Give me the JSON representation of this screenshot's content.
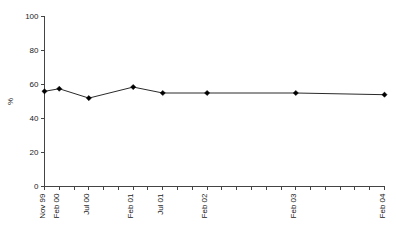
{
  "chart_data": {
    "type": "line",
    "title": "",
    "xlabel": "",
    "ylabel": "%",
    "ylim": [
      0,
      100
    ],
    "yticks": [
      0,
      20,
      40,
      60,
      80,
      100
    ],
    "ytick_labels": [
      "0",
      "20",
      "40",
      "60",
      "80",
      "100"
    ],
    "grid": false,
    "legend": false,
    "legend_position": "none",
    "categories": [
      "Nov 99",
      "Feb 00",
      "Jul 00",
      "Feb 01",
      "Jul 01",
      "Feb 02",
      "Feb 03",
      "Feb 04"
    ],
    "x": [
      0,
      1,
      3,
      6,
      8,
      11,
      17,
      23
    ],
    "values": [
      56,
      57.5,
      52,
      58.5,
      55,
      55,
      55,
      54
    ],
    "x_axis": {
      "minor_tick_count": 24,
      "labeled_ticks": [
        {
          "index": 0,
          "label": "Nov 99"
        },
        {
          "index": 1,
          "label": "Feb 00"
        },
        {
          "index": 3,
          "label": "Jul 00"
        },
        {
          "index": 6,
          "label": "Feb 01"
        },
        {
          "index": 8,
          "label": "Jul 01"
        },
        {
          "index": 11,
          "label": "Feb 02"
        },
        {
          "index": 17,
          "label": "Feb 03"
        },
        {
          "index": 23,
          "label": "Feb 04"
        }
      ]
    },
    "series": [
      {
        "name": "percent",
        "marker": "filled-diamond",
        "color": "#000000",
        "line_color": "#2a2a2a",
        "points": [
          {
            "x_label": "Nov 99",
            "x_index": 0,
            "value": 56
          },
          {
            "x_label": "Feb 00",
            "x_index": 1,
            "value": 57.5
          },
          {
            "x_label": "Jul 00",
            "x_index": 3,
            "value": 52
          },
          {
            "x_label": "Feb 01",
            "x_index": 6,
            "value": 58.5
          },
          {
            "x_label": "Jul 01",
            "x_index": 8,
            "value": 55
          },
          {
            "x_label": "Feb 02",
            "x_index": 11,
            "value": 55
          },
          {
            "x_label": "Feb 03",
            "x_index": 17,
            "value": 55
          },
          {
            "x_label": "Feb 04",
            "x_index": 23,
            "value": 54
          }
        ]
      }
    ]
  },
  "colors": {
    "axis": "#444444",
    "line": "#2a2a2a",
    "marker": "#000000",
    "text": "#1a1a1a",
    "background": "#ffffff"
  }
}
